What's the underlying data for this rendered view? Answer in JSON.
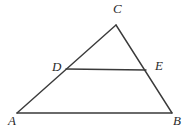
{
  "figure": {
    "type": "geometry-diagram",
    "background_color": "#ffffff",
    "stroke_color": "#3a3a3a",
    "label_color": "#2b2b2b",
    "canvas": {
      "width": 189,
      "height": 130
    },
    "points": [
      {
        "id": "A",
        "label": "A",
        "x": 17,
        "y": 113,
        "label_x": 8,
        "label_y": 114
      },
      {
        "id": "B",
        "label": "B",
        "x": 172,
        "y": 113,
        "label_x": 173,
        "label_y": 114
      },
      {
        "id": "C",
        "label": "C",
        "x": 116,
        "y": 25,
        "label_x": 113,
        "label_y": 2
      },
      {
        "id": "D",
        "label": "D",
        "x": 66,
        "y": 69,
        "label_x": 52,
        "label_y": 60
      },
      {
        "id": "E",
        "label": "E",
        "x": 146,
        "y": 70,
        "label_x": 155,
        "label_y": 59
      }
    ],
    "segments": [
      {
        "id": "AB",
        "from": "A",
        "to": "B",
        "x1": 17,
        "y1": 113,
        "x2": 172,
        "y2": 113,
        "width": 1.4
      },
      {
        "id": "AC",
        "from": "A",
        "to": "C",
        "x1": 17,
        "y1": 113,
        "x2": 116,
        "y2": 25,
        "width": 1.4
      },
      {
        "id": "CB",
        "from": "C",
        "to": "B",
        "x1": 116,
        "y1": 25,
        "x2": 172,
        "y2": 113,
        "width": 1.4
      },
      {
        "id": "DE",
        "from": "D",
        "to": "E",
        "x1": 66,
        "y1": 69,
        "x2": 146,
        "y2": 70,
        "width": 1.4
      }
    ]
  }
}
